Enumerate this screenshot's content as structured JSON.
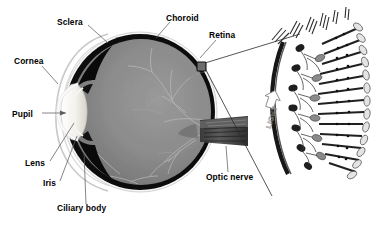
{
  "figure": {
    "title_visible": false,
    "background_color": "#ffffff",
    "width": 392,
    "height": 226
  },
  "labels": {
    "sclera": "Sclera",
    "cornea": "Cornea",
    "pupil": "Pupil",
    "lens": "Lens",
    "iris": "Iris",
    "ciliary_body": "Ciliary body",
    "choroid": "Choroid",
    "retina": "Retina",
    "optic_nerve": "Optic nerve",
    "light": "LIGHT"
  },
  "colors": {
    "text": "#000000",
    "leader_line": "#5d5d5d",
    "vitreous_light": "#8f8f8f",
    "vitreous_dark": "#6e6e6e",
    "choroid_layer": "#101010",
    "sclera_outline": "#cfcfcf",
    "lens_fill": "#f2f0ea",
    "iris_dark": "#0b0b0b",
    "optic_nerve": "#4a4a4a",
    "inset_cell_dark": "#2a2a2a",
    "inset_cell_light": "#d8d8d8",
    "light_arrow": "#8a8a8a"
  },
  "eye_diagram": {
    "view": "sagittal cross-section of the human eye",
    "parts": [
      {
        "name": "sclera",
        "label": "Sclera",
        "label_x": 57,
        "label_y": 22,
        "leader_to_x": 112,
        "leader_to_y": 44
      },
      {
        "name": "cornea",
        "label": "Cornea",
        "label_x": 14,
        "label_y": 61,
        "leader_to_x": 57,
        "leader_to_y": 82
      },
      {
        "name": "pupil",
        "label": "Pupil",
        "label_x": 14,
        "label_y": 117,
        "leader_to_x": 68,
        "leader_to_y": 113,
        "arrow": true
      },
      {
        "name": "lens",
        "label": "Lens",
        "label_x": 28,
        "label_y": 166,
        "leader_to_x": 73,
        "leader_to_y": 124
      },
      {
        "name": "iris",
        "label": "Iris",
        "label_x": 44,
        "label_y": 186,
        "leader_to_x": 74,
        "leader_to_y": 140
      },
      {
        "name": "ciliary-body",
        "label": "Ciliary body",
        "label_x": 58,
        "label_y": 212,
        "leader_to_x": 80,
        "leader_to_y": 152
      },
      {
        "name": "choroid",
        "label": "Choroid",
        "label_x": 165,
        "label_y": 18,
        "leader_to_x": 152,
        "leader_to_y": 38
      },
      {
        "name": "retina",
        "label": "Retina",
        "label_x": 207,
        "label_y": 36,
        "leader_to_x": 196,
        "leader_to_y": 58
      },
      {
        "name": "optic-nerve",
        "label": "Optic nerve",
        "label_x": 207,
        "label_y": 178,
        "leader_to_x": 222,
        "leader_to_y": 148
      }
    ]
  },
  "retina_inset": {
    "description": "magnified cross-section of the retina showing photoreceptor, bipolar and ganglion cell layers",
    "light_direction_label": "LIGHT",
    "light_label_rotation_deg": -72,
    "magnified_from_box": {
      "x": 197,
      "y": 62,
      "w": 9,
      "h": 9
    },
    "layers": [
      {
        "name": "ganglion-cell-axon-layer",
        "position": "left"
      },
      {
        "name": "ganglion-cell-layer",
        "position": "left-mid"
      },
      {
        "name": "bipolar-cell-layer",
        "position": "mid"
      },
      {
        "name": "photoreceptor-layer-rods-cones",
        "position": "right"
      },
      {
        "name": "pigment-epithelium-layer",
        "position": "far-right"
      }
    ]
  }
}
